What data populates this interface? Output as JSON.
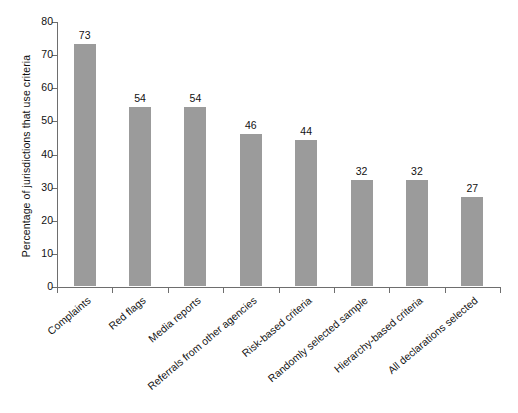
{
  "chart_data": {
    "type": "bar",
    "title": "",
    "subtitle": "",
    "xlabel": "",
    "ylabel": "Percentage of jurisdictions that use criteria",
    "ylim": [
      0,
      80
    ],
    "ytick_labels": [
      "0",
      "10",
      "20",
      "30",
      "40",
      "50",
      "60",
      "70",
      "80"
    ],
    "ytick_values": [
      0,
      10,
      20,
      30,
      40,
      50,
      60,
      70,
      80
    ],
    "grid": false,
    "legend": false,
    "bar_color": "#9b9b9b",
    "axis_color": "#6e6e6e",
    "categories": [
      "Complaints",
      "Red flags",
      "Media reports",
      "Referrals from other agencies",
      "Risk-based criteria",
      "Randomly selected sample",
      "Hierarchy-based criteria",
      "All declarations selected"
    ],
    "values": [
      73,
      54,
      54,
      46,
      44,
      32,
      32,
      27
    ],
    "value_labels": [
      "73",
      "54",
      "54",
      "46",
      "44",
      "32",
      "32",
      "27"
    ]
  }
}
